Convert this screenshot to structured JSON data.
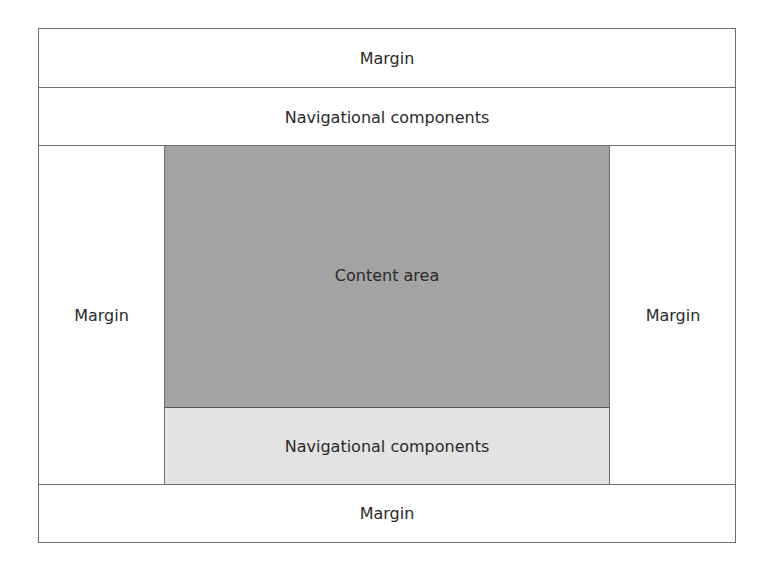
{
  "diagram": {
    "top_margin": {
      "label": "Margin"
    },
    "top_nav": {
      "label": "Navigational components"
    },
    "left_margin": {
      "label": "Margin"
    },
    "content_area": {
      "label": "Content area",
      "color": "#a3a3a3"
    },
    "right_margin": {
      "label": "Margin"
    },
    "bottom_nav": {
      "label": "Navigational components",
      "color": "#e3e3e3"
    },
    "bottom_margin": {
      "label": "Margin"
    }
  }
}
